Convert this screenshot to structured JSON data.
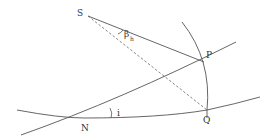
{
  "diagram": {
    "type": "celestial-geometry",
    "labels": {
      "S": "S",
      "P": "P",
      "N": "N",
      "Q": "Q",
      "i": "i",
      "beta": "β",
      "beta_sub": "h"
    },
    "colors": {
      "line": "#555555",
      "dashed": "#666666",
      "text": "#333333",
      "background": "#ffffff"
    },
    "points": {
      "S": [
        88,
        16
      ],
      "P": [
        204,
        62
      ],
      "N": [
        84,
        118
      ],
      "Q": [
        207,
        110
      ]
    }
  }
}
